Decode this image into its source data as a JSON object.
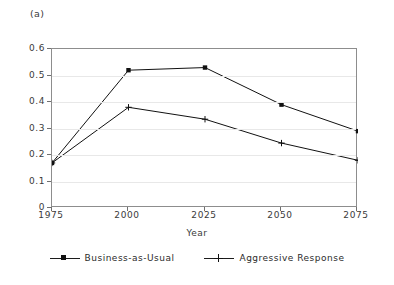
{
  "figure": {
    "panel_label": "(a)"
  },
  "chart_data": {
    "type": "line",
    "title": "(a)",
    "xlabel": "Year",
    "ylabel": "",
    "x": [
      1975,
      2000,
      2025,
      2050,
      2075
    ],
    "xticks": [
      "1975",
      "2000",
      "2025",
      "2050",
      "2075"
    ],
    "yticks": [
      "0",
      "0.1",
      "0.2",
      "0.3",
      "0.4",
      "0.5",
      "0.6"
    ],
    "ytick_values": [
      0,
      0.1,
      0.2,
      0.3,
      0.4,
      0.5,
      0.6
    ],
    "xlim": [
      1975,
      2075
    ],
    "ylim": [
      0,
      0.6
    ],
    "grid": "horizontal",
    "legend_position": "below",
    "series": [
      {
        "name": "Business-as-Usual",
        "marker": "square",
        "color": "#111111",
        "values": [
          0.17,
          0.52,
          0.53,
          0.39,
          0.29
        ]
      },
      {
        "name": "Aggressive Response",
        "marker": "plus",
        "color": "#111111",
        "values": [
          0.17,
          0.38,
          0.335,
          0.245,
          0.18
        ]
      }
    ]
  },
  "legend": {
    "items": [
      {
        "label": "Business-as-Usual"
      },
      {
        "label": "Aggressive Response"
      }
    ]
  },
  "colors": {
    "frame": "#8d8d8d",
    "grid": "#e8e8e8",
    "line": "#1c1c1c",
    "text": "#2b2b2b",
    "background": "#ffffff"
  }
}
